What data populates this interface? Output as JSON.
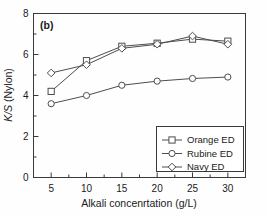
{
  "figure": {
    "panel_label": "(b)",
    "background_color": "#fefefe",
    "frame_color": "#3a3a3a",
    "series_color": "#4d4d4d"
  },
  "chart_data": {
    "type": "line",
    "title": "",
    "panel": "(b)",
    "xlabel": "Alkali concenrtation (g/L)",
    "ylabel": "K/S (Nylon)",
    "ylabel_italic_part": "K/S",
    "ylabel_rest": " (Nylon)",
    "x": [
      5,
      10,
      15,
      20,
      25,
      30
    ],
    "xticklabels": [
      "5",
      "10",
      "15",
      "20",
      "25",
      "30"
    ],
    "yticks": [
      0,
      2,
      4,
      6,
      8
    ],
    "yticklabels": [
      "0",
      "2",
      "4",
      "6",
      "8"
    ],
    "xlim": [
      2.5,
      32.5
    ],
    "ylim": [
      0,
      8
    ],
    "grid": false,
    "legend_position": "lower right inside axes",
    "series": [
      {
        "name": "Orange ED",
        "marker": "square",
        "values": [
          4.2,
          5.7,
          6.4,
          6.55,
          6.75,
          6.65
        ]
      },
      {
        "name": "Rubine ED",
        "marker": "circle",
        "values": [
          3.6,
          4.0,
          4.5,
          4.7,
          4.83,
          4.9
        ]
      },
      {
        "name": "Navy ED",
        "marker": "diamond",
        "values": [
          5.1,
          5.5,
          6.3,
          6.5,
          6.9,
          6.5
        ]
      }
    ]
  },
  "legend": {
    "items": [
      {
        "label": "Orange ED",
        "marker": "square"
      },
      {
        "label": "Rubine ED",
        "marker": "circle"
      },
      {
        "label": "Navy ED",
        "marker": "diamond"
      }
    ]
  }
}
